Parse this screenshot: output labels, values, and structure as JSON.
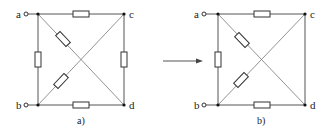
{
  "figure_a": {
    "caption": "a)",
    "nodes": {
      "a": "a",
      "b": "b",
      "c": "c",
      "d": "d"
    },
    "resistors": [
      "a-c (top)",
      "a-b (left)",
      "c-d (right)",
      "b-d (bottom)",
      "a-d (diagonal)",
      "b-c (diagonal)"
    ]
  },
  "figure_b": {
    "caption": "b)",
    "nodes": {
      "a": "a",
      "b": "b",
      "c": "c",
      "d": "d"
    },
    "resistors": [
      "a-c (top)",
      "a-b (left)",
      "b-d (bottom)",
      "a-d (diagonal)",
      "b-c (diagonal)"
    ],
    "short_circuits": [
      "c-d (right)"
    ]
  },
  "transform_arrow": "right-arrow",
  "colors": {
    "line": "#555555",
    "node": "#111111",
    "background": "#ffffff"
  }
}
